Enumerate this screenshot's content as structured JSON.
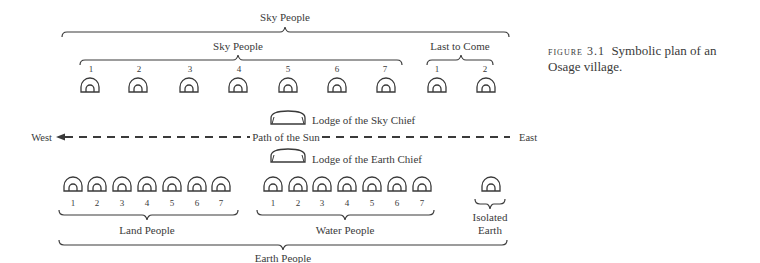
{
  "figure": {
    "label": "figure 3.1",
    "caption": "Symbolic plan of an Osage village."
  },
  "sky": {
    "outer_label": "Sky People",
    "inner_label": "Sky People",
    "last_to_come_label": "Last to Come",
    "sky_people_numbers": [
      "1",
      "2",
      "3",
      "4",
      "5",
      "6",
      "7"
    ],
    "last_to_come_numbers": [
      "1",
      "2"
    ]
  },
  "center": {
    "sky_chief_label": "Lodge of the Sky Chief",
    "earth_chief_label": "Lodge of the Earth Chief",
    "path_label": "Path of the Sun",
    "west_label": "West",
    "east_label": "East"
  },
  "earth": {
    "land_label": "Land People",
    "water_label": "Water People",
    "isolated_label_line1": "Isolated",
    "isolated_label_line2": "Earth",
    "outer_label": "Earth People",
    "land_numbers": [
      "1",
      "2",
      "3",
      "4",
      "5",
      "6",
      "7"
    ],
    "water_numbers": [
      "1",
      "2",
      "3",
      "4",
      "5",
      "6",
      "7"
    ]
  },
  "colors": {
    "ink": "#3a3a3a",
    "background": "#ffffff"
  }
}
